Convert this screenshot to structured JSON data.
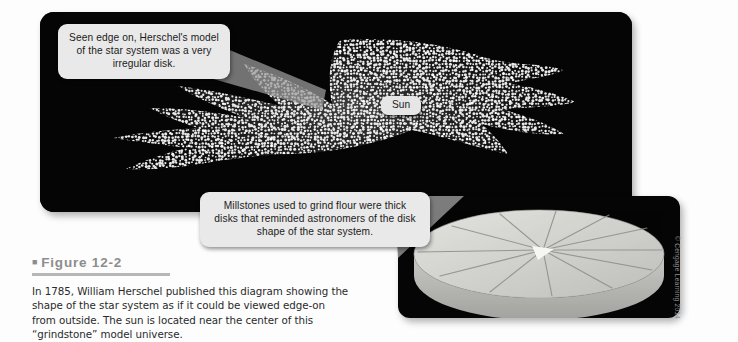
{
  "figure": {
    "number_label": "Figure 12-2",
    "bullet_glyph": "■",
    "caption": "In 1785, William Herschel published this diagram showing the shape of the star system as if it could be viewed edge-on from outside. The sun is located near the center of this “grindstone” model universe."
  },
  "callouts": {
    "edge_on": "Seen edge on, Herschel's model of the star system was a very irregular disk.",
    "millstone": "Millstones used to grind flour were thick disks that reminded astronomers of the disk shape of the star system."
  },
  "labels": {
    "sun": "Sun"
  },
  "credit": "© Cengage Learning 2014",
  "icons": {
    "square_bullet": "square-bullet-icon",
    "star_cloud": "star-cloud-icon",
    "millstone_disk": "millstone-disk-icon",
    "callout_pointer": "callout-pointer-icon"
  },
  "colors": {
    "panel_background": "#050505",
    "callout_background": "#e9e9e9",
    "star_color": "#f2f2f2",
    "millstone_top": "#d5d5d2",
    "millstone_side": "#b9b9b6",
    "figure_title": "#8d8d8d",
    "caption_text": "#2a2a2a",
    "credit_text": "#8f8f8f",
    "page_background": "#ffffff"
  }
}
